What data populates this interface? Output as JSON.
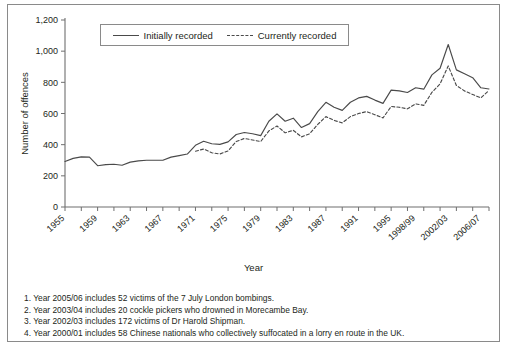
{
  "chart_data": {
    "type": "line",
    "title": "",
    "xlabel": "Year",
    "ylabel": "Number of offences",
    "ylim": [
      0,
      1200
    ],
    "yticks": [
      0,
      200,
      400,
      600,
      800,
      1000,
      1200
    ],
    "ytick_labels": [
      "0",
      "200",
      "400",
      "600",
      "800",
      "1,000",
      "1,200"
    ],
    "grid": false,
    "legend_position": "top-center",
    "x": [
      "1955",
      "1956",
      "1957",
      "1958",
      "1959",
      "1960",
      "1961",
      "1962",
      "1963",
      "1964",
      "1965",
      "1966",
      "1967",
      "1968",
      "1969",
      "1970",
      "1971",
      "1972",
      "1973",
      "1974",
      "1975",
      "1976",
      "1977",
      "1978",
      "1979",
      "1980",
      "1981",
      "1982",
      "1983",
      "1984",
      "1985",
      "1986",
      "1987",
      "1988",
      "1989",
      "1990",
      "1991",
      "1992",
      "1993",
      "1994",
      "1995",
      "1996",
      "1997",
      "1998/99",
      "1999/00",
      "2000/01",
      "2001/02",
      "2002/03",
      "2003/04",
      "2004/05",
      "2005/06",
      "2006/07",
      "2007/08"
    ],
    "xtick_labels": [
      "1955",
      "1959",
      "1963",
      "1967",
      "1971",
      "1975",
      "1979",
      "1983",
      "1987",
      "1991",
      "1995",
      "1998/99",
      "2002/03",
      "2006/07"
    ],
    "xtick_indices": [
      0,
      4,
      8,
      12,
      16,
      20,
      24,
      28,
      32,
      36,
      40,
      43,
      47,
      51
    ],
    "series": [
      {
        "name": "Initially recorded",
        "style": "solid",
        "color": "#4a4a4a",
        "values": [
          292,
          312,
          322,
          320,
          265,
          272,
          274,
          268,
          288,
          296,
          300,
          300,
          300,
          320,
          330,
          340,
          396,
          422,
          406,
          402,
          418,
          465,
          478,
          470,
          458,
          550,
          598,
          550,
          570,
          510,
          535,
          612,
          672,
          640,
          620,
          672,
          700,
          710,
          686,
          665,
          750,
          745,
          735,
          765,
          756,
          848,
          890,
          1043,
          880,
          855,
          830,
          765,
          757
        ]
      },
      {
        "name": "Currently recorded",
        "style": "dashed",
        "color": "#4a4a4a",
        "values": [
          null,
          null,
          null,
          null,
          null,
          null,
          null,
          null,
          null,
          null,
          null,
          null,
          null,
          null,
          null,
          null,
          358,
          372,
          348,
          340,
          360,
          420,
          440,
          430,
          420,
          488,
          520,
          476,
          492,
          450,
          470,
          530,
          580,
          556,
          540,
          580,
          600,
          612,
          592,
          572,
          645,
          640,
          630,
          662,
          652,
          736,
          790,
          905,
          780,
          745,
          722,
          700,
          748
        ]
      }
    ]
  },
  "legend": {
    "items": [
      {
        "label": "Initially recorded",
        "style": "solid"
      },
      {
        "label": "Currently recorded",
        "style": "dashed"
      }
    ]
  },
  "notes": [
    "1. Year 2005/06 includes 52 victims of the 7 July London bombings.",
    "2. Year 2003/04 includes 20 cockle pickers who drowned in Morecambe Bay.",
    "3. Year 2002/03 includes 172 victims of Dr Harold Shipman.",
    "4. Year 2000/01 includes 58 Chinese nationals who collectively suffocated in a lorry en route in the UK."
  ]
}
